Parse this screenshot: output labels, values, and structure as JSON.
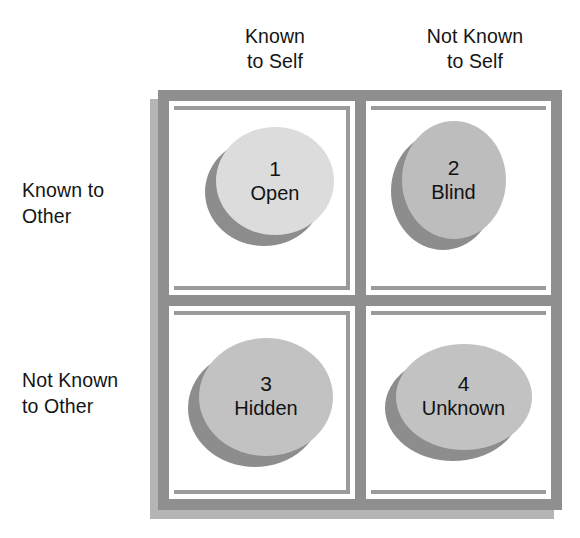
{
  "diagram": {
    "column_headers": [
      {
        "label": "Known\nto Self"
      },
      {
        "label": "Not Known\nto Self"
      }
    ],
    "row_labels": [
      {
        "label": "Known to\nOther"
      },
      {
        "label": "Not Known\nto Other"
      }
    ],
    "quadrants": [
      {
        "number": "1",
        "name": "Open",
        "fill": "#dcdcdc",
        "shadow": "#8d8d8d"
      },
      {
        "number": "2",
        "name": "Blind",
        "fill": "#bdbdbd",
        "shadow": "#8d8d8d"
      },
      {
        "number": "3",
        "name": "Hidden",
        "fill": "#c2c2c2",
        "shadow": "#8d8d8d"
      },
      {
        "number": "4",
        "name": "Unknown",
        "fill": "#c2c2c2",
        "shadow": "#8d8d8d"
      }
    ],
    "colors": {
      "frame": "#8f8f8f",
      "frame_inner_rule": "#9a9a9a",
      "frame_shadow": "#a8a8a8",
      "cell_background": "#ffffff",
      "text": "#141414",
      "page_background": "#ffffff"
    }
  }
}
